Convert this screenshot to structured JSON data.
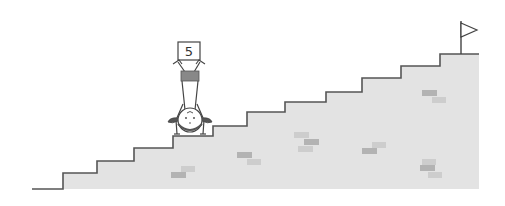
{
  "scene": {
    "description": "Stick figure doing a handstand on a staircase, holding a numbered sign with its feet; flag at top of stairs",
    "sign_number": "5",
    "colors": {
      "background": "#ffffff",
      "stairs_fill": "#e3e3e3",
      "stairs_outline": "#555555",
      "brick_dark": "#b3b3b3",
      "brick_light": "#cdcdcd",
      "figure_line": "#444444",
      "figure_band": "#888888"
    },
    "stairs": {
      "step_count": 12,
      "points": [
        [
          32,
          189
        ],
        [
          63,
          189
        ],
        [
          63,
          173
        ],
        [
          97,
          173
        ],
        [
          97,
          161
        ],
        [
          134,
          161
        ],
        [
          134,
          148
        ],
        [
          173,
          148
        ],
        [
          173,
          136
        ],
        [
          213,
          136
        ],
        [
          213,
          126
        ],
        [
          247,
          126
        ],
        [
          247,
          112
        ],
        [
          285,
          112
        ],
        [
          285,
          102
        ],
        [
          326,
          102
        ],
        [
          326,
          92
        ],
        [
          362,
          92
        ],
        [
          362,
          78
        ],
        [
          401,
          78
        ],
        [
          401,
          66
        ],
        [
          440,
          66
        ],
        [
          440,
          54
        ],
        [
          479,
          54
        ]
      ]
    },
    "flag": {
      "pole_x": 461,
      "pole_top": 21,
      "pole_bottom": 54
    },
    "bricks": [
      {
        "x": 171,
        "y": 172,
        "w": 15,
        "h": 6,
        "tone": "dark"
      },
      {
        "x": 181,
        "y": 166,
        "w": 14,
        "h": 6,
        "tone": "light"
      },
      {
        "x": 237,
        "y": 152,
        "w": 15,
        "h": 6,
        "tone": "dark"
      },
      {
        "x": 247,
        "y": 159,
        "w": 14,
        "h": 6,
        "tone": "light"
      },
      {
        "x": 294,
        "y": 132,
        "w": 15,
        "h": 6,
        "tone": "light"
      },
      {
        "x": 304,
        "y": 139,
        "w": 15,
        "h": 6,
        "tone": "dark"
      },
      {
        "x": 298,
        "y": 146,
        "w": 15,
        "h": 6,
        "tone": "light"
      },
      {
        "x": 362,
        "y": 148,
        "w": 15,
        "h": 6,
        "tone": "dark"
      },
      {
        "x": 372,
        "y": 142,
        "w": 14,
        "h": 6,
        "tone": "light"
      },
      {
        "x": 422,
        "y": 90,
        "w": 15,
        "h": 6,
        "tone": "dark"
      },
      {
        "x": 432,
        "y": 97,
        "w": 14,
        "h": 6,
        "tone": "light"
      },
      {
        "x": 422,
        "y": 159,
        "w": 14,
        "h": 6,
        "tone": "light"
      },
      {
        "x": 420,
        "y": 165,
        "w": 15,
        "h": 6,
        "tone": "dark"
      },
      {
        "x": 428,
        "y": 172,
        "w": 14,
        "h": 6,
        "tone": "light"
      }
    ]
  }
}
